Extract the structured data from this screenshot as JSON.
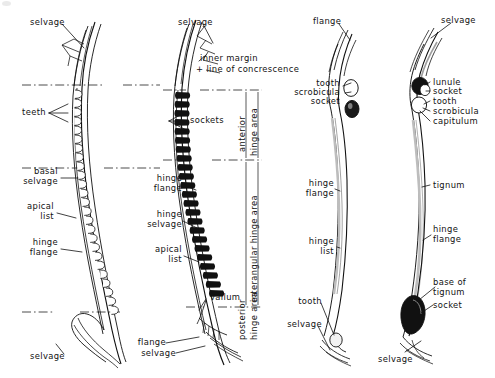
{
  "figure": {
    "type": "scientific-line-illustration",
    "background_color": "#ffffff",
    "ink_color": "#111111",
    "panel_count": 4
  },
  "panels": [
    {
      "id": "panel-1",
      "position": "far-left",
      "description": "Curved hinge plate with outlined (white) teeth",
      "labels": [
        "selvage",
        "teeth",
        "basal selvage",
        "apical list",
        "hinge flange",
        "selvage"
      ]
    },
    {
      "id": "panel-2",
      "position": "center-left",
      "description": "Curved hinge plate with solid black sockets",
      "labels": [
        "selvage",
        "inner margin + line of concrescence",
        "sockets",
        "hinge flange",
        "hinge selvage",
        "apical list",
        "vallum",
        "flange",
        "selvage"
      ]
    },
    {
      "id": "panel-3",
      "position": "center-right",
      "description": "Elongate narrow valve, white tooth above dark socket",
      "labels": [
        "flange",
        "tooth",
        "scrobicula",
        "socket",
        "hinge flange",
        "hinge list",
        "tooth",
        "selvage"
      ]
    },
    {
      "id": "panel-4",
      "position": "far-right",
      "description": "Elongate narrow valve with dark lunule and basal socket",
      "labels": [
        "selvage",
        "lunule",
        "socket",
        "tooth",
        "scrobicula",
        "capitulum",
        "tignum",
        "hinge flange",
        "base of tignum",
        "socket",
        "selvage"
      ]
    }
  ],
  "labels": {
    "p1_selvage_top": "selvage",
    "p1_teeth": "teeth",
    "p1_basal_selvage": "basal\nselvage",
    "p1_apical_list": "apical\nlist",
    "p1_hinge_flange": "hinge\nflange",
    "p1_selvage_bottom": "selvage",
    "p2_selvage_top": "selvage",
    "p2_inner_margin": "inner margin",
    "p2_line_concrescence": "+ line of concrescence",
    "p2_sockets": "sockets",
    "p2_hinge_flange": "hinge\nflange",
    "p2_hinge_selvage": "hinge\nselvage",
    "p2_apical_list": "apical\nlist",
    "p2_vallum": "vallum",
    "p2_flange": "flange",
    "p2_selvage_bottom": "selvage",
    "region_anterior": "anterior",
    "region_anterior_area": "hinge area",
    "region_interangular": "interangular hinge area",
    "region_posterior": "posterior",
    "region_posterior_area": "hinge area",
    "p3_flange": "flange",
    "p3_tooth_top": "tooth",
    "p3_scrobicula": "scrobicula",
    "p3_socket": "socket",
    "p3_hinge_flange": "hinge\nflange",
    "p3_hinge_list": "hinge\nlist",
    "p3_tooth_bottom": "tooth",
    "p3_selvage": "selvage",
    "p4_selvage_top": "selvage",
    "p4_lunule": "lunule",
    "p4_socket_top": "socket",
    "p4_tooth": "tooth",
    "p4_scrobicula": "scrobicula",
    "p4_capitulum": "capitulum",
    "p4_tignum": "tignum",
    "p4_hinge_flange": "hinge\nflange",
    "p4_base_of_tignum": "base of\ntignum",
    "p4_socket_bottom": "socket",
    "p4_selvage_bottom": "selvage"
  }
}
